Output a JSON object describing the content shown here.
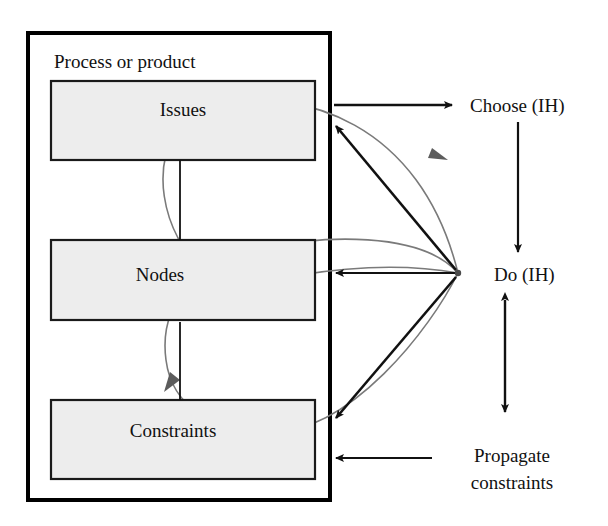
{
  "diagram": {
    "title": "Process or product",
    "container": {
      "label": "Process or product",
      "border_color": "#000000",
      "fill_color": "#ffffff"
    },
    "boxes": [
      {
        "id": "issues",
        "label": "Issues",
        "fill_color": "#ededed",
        "border_color": "#1a1a1a"
      },
      {
        "id": "nodes",
        "label": "Nodes",
        "fill_color": "#ededed",
        "border_color": "#1a1a1a"
      },
      {
        "id": "constraints",
        "label": "Constraints",
        "fill_color": "#ededed",
        "border_color": "#1a1a1a"
      }
    ],
    "side_labels": [
      {
        "id": "choose",
        "label": "Choose (IH)"
      },
      {
        "id": "do",
        "label": "Do (IH)"
      },
      {
        "id": "propagate",
        "line1": "Propagate",
        "line2": "constraints"
      }
    ],
    "connectors": {
      "issues_to_choose": "arrow-right",
      "do_to_issues": "arrow-up-left",
      "do_to_nodes": "arrow-left",
      "do_to_constraints": "arrow-down-left",
      "propagate_to_container": "arrow-left",
      "choose_to_do": "arrow-down",
      "do_to_propagate": "arrow-double-vertical",
      "issues_to_nodes": "arrow-down",
      "constraints_to_nodes": "arrow-up"
    },
    "colors": {
      "arrow_black": "#111111",
      "loop_gray": "#6e6e6e",
      "box_fill": "#ededed",
      "background": "#ffffff"
    }
  }
}
